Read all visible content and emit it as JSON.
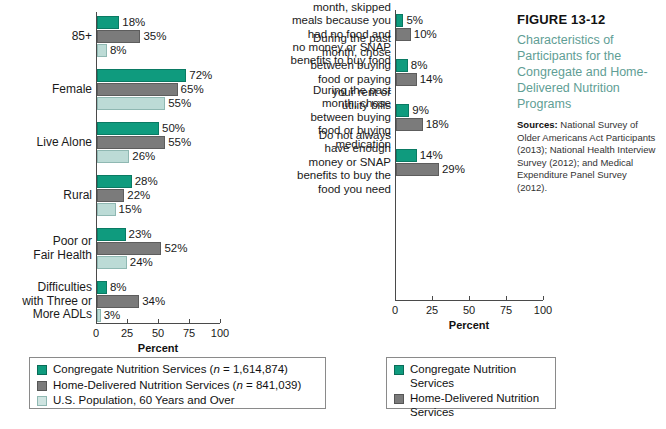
{
  "caption": {
    "figure_number": "FIGURE 13-12",
    "title": "Characteristics of Participants for the Congregate and Home-Delivered Nutrition Programs",
    "sources_label": "Sources:",
    "sources_text": " National Survey of Older Americans Act Participants (2013); National Health Interview Survey (2012); and Medical Expenditure Panel Survey (2012)."
  },
  "colors": {
    "congregate": "#0f9b7e",
    "home_delivered": "#7b7b7b",
    "us_population": "#bcdbd6",
    "title_teal": "#5f9e95"
  },
  "left_legend": {
    "items": [
      {
        "label_pre": "Congregate Nutrition Services (",
        "n": "n",
        "label_post": " = 1,614,874)",
        "color_key": "congregate"
      },
      {
        "label_pre": "Home-Delivered Nutrition Services (",
        "n": "n",
        "label_post": " = 841,039)",
        "color_key": "home_delivered"
      },
      {
        "label_pre": "U.S. Population, 60 Years and Over",
        "n": "",
        "label_post": "",
        "color_key": "us_population"
      }
    ]
  },
  "right_legend": {
    "items": [
      {
        "label_pre": "Congregate Nutrition Services",
        "n": "",
        "label_post": "",
        "color_key": "congregate"
      },
      {
        "label_pre": "Home-Delivered Nutrition Services",
        "n": "",
        "label_post": "",
        "color_key": "home_delivered"
      }
    ]
  },
  "chart_data": [
    {
      "id": "left-chart",
      "type": "bar",
      "orientation": "horizontal",
      "title": "",
      "xlabel": "Percent",
      "ylabel": "",
      "xlim": [
        0,
        100
      ],
      "xticks": [
        0,
        25,
        50,
        75,
        100
      ],
      "xticklabels": [
        "0",
        "25",
        "50",
        "75",
        "100"
      ],
      "grid": false,
      "legend_position": "bottom-left",
      "categories": [
        "85+",
        "Female",
        "Live Alone",
        "Rural",
        "Poor or\nFair Health",
        "Difficulties\nwith Three or\nMore ADLs"
      ],
      "series": [
        {
          "name": "Congregate Nutrition Services",
          "color_key": "congregate",
          "values": [
            18,
            72,
            50,
            28,
            23,
            8
          ],
          "labels": [
            "18%",
            "72%",
            "50%",
            "28%",
            "23%",
            "8%"
          ]
        },
        {
          "name": "Home-Delivered Nutrition Services",
          "color_key": "home_delivered",
          "values": [
            35,
            65,
            55,
            22,
            52,
            34
          ],
          "labels": [
            "35%",
            "65%",
            "55%",
            "22%",
            "52%",
            "34%"
          ]
        },
        {
          "name": "U.S. Population, 60 Years and Over",
          "color_key": "us_population",
          "values": [
            8,
            55,
            26,
            15,
            24,
            3
          ],
          "labels": [
            "8%",
            "55%",
            "26%",
            "15%",
            "24%",
            "3%"
          ]
        }
      ]
    },
    {
      "id": "right-chart",
      "type": "bar",
      "orientation": "horizontal",
      "title": "",
      "xlabel": "Percent",
      "ylabel": "",
      "xlim": [
        0,
        100
      ],
      "xticks": [
        0,
        25,
        50,
        75,
        100
      ],
      "xticklabels": [
        "0",
        "25",
        "50",
        "75",
        "100"
      ],
      "grid": false,
      "legend_position": "bottom-center",
      "categories": [
        "During the past\nmonth, skipped\nmeals because you\nhad no food and\nno money or SNAP\nbenefits to buy food",
        "During the past\nmonth, chose\nbetween buying\nfood or paying\nyour rent or\nutility bills",
        "During the past\nmonth, chose\nbetween buying\nfood or buying\nmedication",
        "Do not always\nhave enough\nmoney or SNAP\nbenefits to buy the\nfood you need"
      ],
      "series": [
        {
          "name": "Congregate Nutrition Services",
          "color_key": "congregate",
          "values": [
            5,
            8,
            9,
            14
          ],
          "labels": [
            "5%",
            "8%",
            "9%",
            "14%"
          ]
        },
        {
          "name": "Home-Delivered Nutrition Services",
          "color_key": "home_delivered",
          "values": [
            10,
            14,
            18,
            29
          ],
          "labels": [
            "10%",
            "14%",
            "18%",
            "29%"
          ]
        }
      ]
    }
  ]
}
